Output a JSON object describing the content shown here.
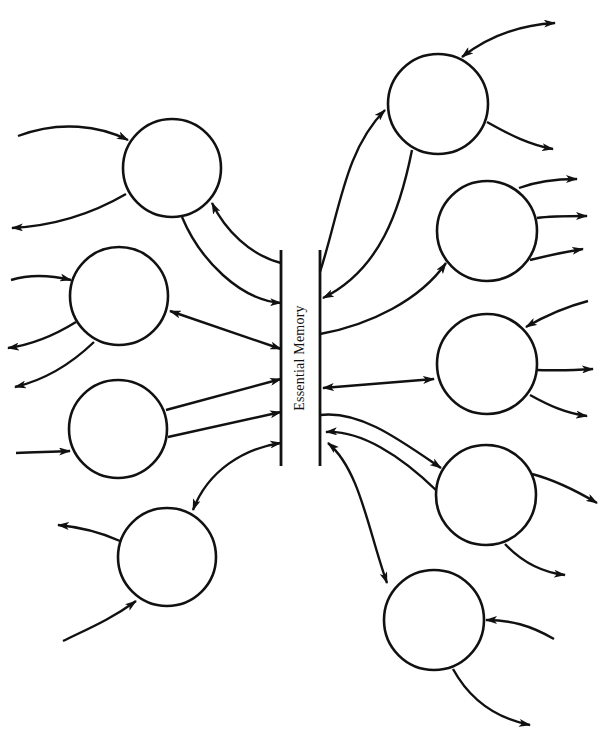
{
  "diagram": {
    "title": "Essential Memory",
    "center": {
      "label": "Essential Memory",
      "left_bar": {
        "x": 281,
        "y1": 250,
        "y2": 466
      },
      "right_bar": {
        "x": 320,
        "y1": 250,
        "y2": 466
      }
    },
    "nodes": [
      {
        "id": "L1",
        "cx": 172,
        "cy": 168,
        "r": 49
      },
      {
        "id": "L2",
        "cx": 119,
        "cy": 296,
        "r": 49
      },
      {
        "id": "L3",
        "cx": 118,
        "cy": 429,
        "r": 49
      },
      {
        "id": "L4",
        "cx": 167,
        "cy": 557,
        "r": 49
      },
      {
        "id": "R1",
        "cx": 438,
        "cy": 104,
        "r": 50
      },
      {
        "id": "R2",
        "cx": 487,
        "cy": 231,
        "r": 50
      },
      {
        "id": "R3",
        "cx": 487,
        "cy": 364,
        "r": 50
      },
      {
        "id": "R4",
        "cx": 486,
        "cy": 495,
        "r": 50
      },
      {
        "id": "R5",
        "cx": 434,
        "cy": 620,
        "r": 50
      }
    ],
    "connections": [
      {
        "from": "L1",
        "to": "Essential Memory",
        "direction": "out"
      },
      {
        "from": "Essential Memory",
        "to": "L1",
        "direction": "in"
      },
      {
        "from": "L2",
        "to": "Essential Memory",
        "direction": "bidirectional"
      },
      {
        "from": "L3",
        "to": "Essential Memory",
        "direction": "out",
        "count": 2
      },
      {
        "from": "Essential Memory",
        "to": "L4",
        "direction": "bidirectional"
      },
      {
        "from": "Essential Memory",
        "to": "R1",
        "direction": "in"
      },
      {
        "from": "R1",
        "to": "Essential Memory",
        "direction": "out"
      },
      {
        "from": "Essential Memory",
        "to": "R2",
        "direction": "bidirectional"
      },
      {
        "from": "R3",
        "to": "Essential Memory",
        "direction": "bidirectional"
      },
      {
        "from": "Essential Memory",
        "to": "R4",
        "direction": "out"
      },
      {
        "from": "R4",
        "to": "Essential Memory",
        "direction": "out"
      },
      {
        "from": "Essential Memory",
        "to": "R5",
        "direction": "bidirectional"
      }
    ],
    "external_links": {
      "L1": {
        "inputs": 1,
        "outputs": 1
      },
      "L2": {
        "inputs": 1,
        "outputs": 2
      },
      "L3": {
        "inputs": 1,
        "outputs": 0
      },
      "L4": {
        "inputs": 1,
        "outputs": 1
      },
      "R1": {
        "inputs": 0,
        "outputs": 2,
        "bidirectional": 1
      },
      "R2": {
        "inputs": 0,
        "outputs": 3
      },
      "R3": {
        "inputs": 1,
        "outputs": 2
      },
      "R4": {
        "inputs": 0,
        "outputs": 2
      },
      "R5": {
        "inputs": 1,
        "outputs": 1
      }
    },
    "colors": {
      "stroke": "#111111",
      "background": "#ffffff"
    }
  }
}
